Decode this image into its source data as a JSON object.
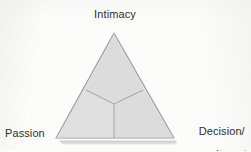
{
  "figure": {
    "name": "triangular-theory-of-love",
    "background_color": "#fcfcfb",
    "shape": {
      "type": "triangle",
      "fill_color": "#dedede",
      "stroke_color": "#9a9a9a",
      "shadow_color": "#c9c9c9",
      "divider_color": "#a4a4a4",
      "vertices": {
        "apex": [
          114,
          33
        ],
        "bottom_left": [
          56,
          138
        ],
        "bottom_right": [
          174,
          138
        ]
      },
      "centroid": [
        114,
        104
      ],
      "divider_endpoints": {
        "left_edge": [
          86,
          90
        ],
        "right_edge": [
          143,
          90
        ],
        "base": [
          114,
          138
        ]
      },
      "regions": [
        {
          "name": "intimacy-region",
          "position": "top"
        },
        {
          "name": "passion-region",
          "position": "bottom-left"
        },
        {
          "name": "decision-commitment-region",
          "position": "bottom-right"
        }
      ]
    },
    "labels": {
      "apex": "Intimacy",
      "bottom_left": "Passion",
      "bottom_right_line1": "Decision/",
      "bottom_right_line2": "commitment"
    }
  }
}
